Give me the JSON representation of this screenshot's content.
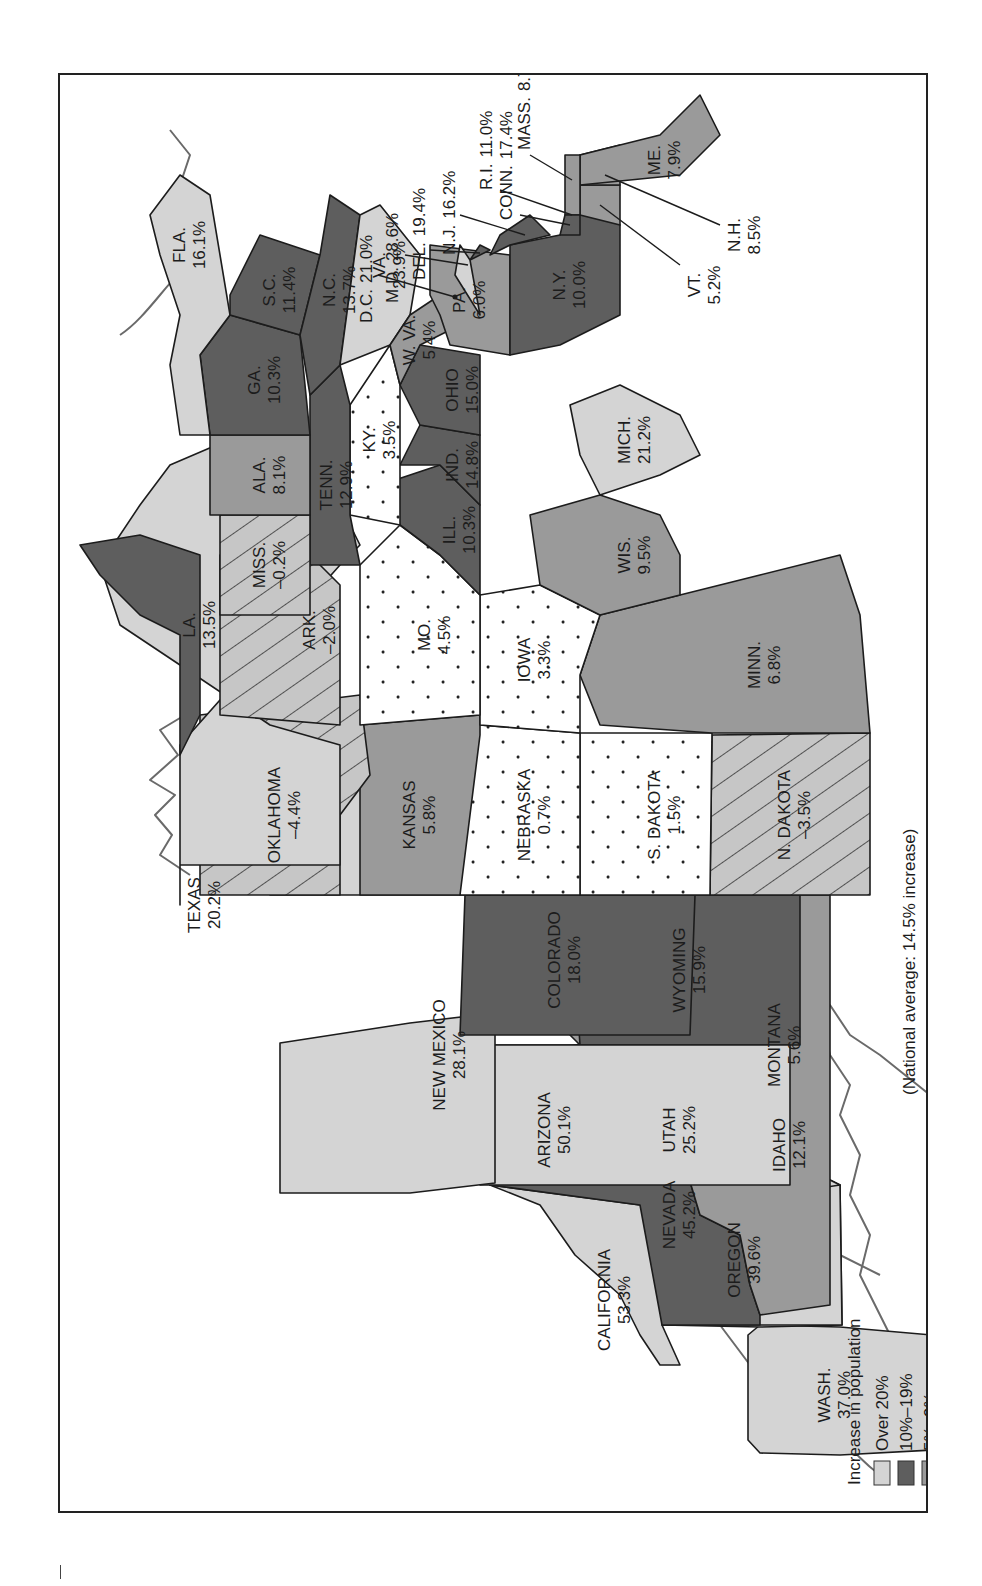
{
  "legend": {
    "increase_title": "Increase in population",
    "decrease_title": "Decrease in population",
    "items": [
      {
        "label": "Over 20%",
        "color": "#d4d4d4",
        "pattern": "solid"
      },
      {
        "label": "10%–19%",
        "color": "#5e5e5e",
        "pattern": "solid"
      },
      {
        "label": "5%–9%",
        "color": "#9a9a9a",
        "pattern": "solid"
      },
      {
        "label": "0%–4%",
        "color": "#ffffff",
        "pattern": "dots"
      },
      {
        "label": "0%–5%",
        "color": "#c6c6c6",
        "pattern": "hatch"
      }
    ]
  },
  "note": "(National average: 14.5% increase)",
  "states": {
    "wa": {
      "name": "WASH.",
      "value": "37.0%"
    },
    "or": {
      "name": "OREGON",
      "value": "39.6%"
    },
    "ca": {
      "name": "CALIFORNIA",
      "value": "53.3%"
    },
    "nv": {
      "name": "NEVADA",
      "value": "45.2%"
    },
    "id": {
      "name": "IDAHO",
      "value": "12.1%"
    },
    "mt": {
      "name": "MONTANA",
      "value": "5.6%"
    },
    "wy": {
      "name": "WYOMING",
      "value": "15.9%"
    },
    "ut": {
      "name": "UTAH",
      "value": "25.2%"
    },
    "az": {
      "name": "ARIZONA",
      "value": "50.1%"
    },
    "co": {
      "name": "COLORADO",
      "value": "18.0%"
    },
    "nm": {
      "name": "NEW MEXICO",
      "value": "28.1%"
    },
    "nd": {
      "name": "N. DAKOTA",
      "value": "–3.5%"
    },
    "sd": {
      "name": "S. DAKOTA",
      "value": "1.5%"
    },
    "ne": {
      "name": "NEBRASKA",
      "value": "0.7%"
    },
    "ks": {
      "name": "KANSAS",
      "value": "5.8%"
    },
    "ok": {
      "name": "OKLAHOMA",
      "value": "–4.4%"
    },
    "tx": {
      "name": "TEXAS",
      "value": "20.2%"
    },
    "mn": {
      "name": "MINN.",
      "value": "6.8%"
    },
    "ia": {
      "name": "IOWA",
      "value": "3.3%"
    },
    "mo": {
      "name": "MO.",
      "value": "4.5%"
    },
    "ar": {
      "name": "ARK.",
      "value": "–2.0%"
    },
    "la": {
      "name": "LA.",
      "value": "13.5%"
    },
    "wi": {
      "name": "WIS.",
      "value": "9.5%"
    },
    "il": {
      "name": "ILL.",
      "value": "10.3%"
    },
    "mi": {
      "name": "MICH.",
      "value": "21.2%"
    },
    "in": {
      "name": "IND.",
      "value": "14.8%"
    },
    "oh": {
      "name": "OHIO",
      "value": "15.0%"
    },
    "ky": {
      "name": "KY.",
      "value": "3.5%"
    },
    "tn": {
      "name": "TENN.",
      "value": "12.9%"
    },
    "ms": {
      "name": "MISS.",
      "value": "–0.2%"
    },
    "al": {
      "name": "ALA.",
      "value": "8.1%"
    },
    "ga": {
      "name": "GA.",
      "value": "10.3%"
    },
    "fl": {
      "name": "FLA.",
      "value": "16.1%"
    },
    "sc": {
      "name": "S.C.",
      "value": "11.4%"
    },
    "nc": {
      "name": "N.C.",
      "value": "13.7%"
    },
    "va": {
      "name": "VA.",
      "value": "23.9%"
    },
    "wv": {
      "name": "W. VA.",
      "value": "5.4%"
    },
    "pa": {
      "name": "PA.",
      "value": "6.0%"
    },
    "ny": {
      "name": "N.Y.",
      "value": "10.0%"
    },
    "vt": {
      "name": "VT.",
      "value": "5.2%"
    },
    "nh": {
      "name": "N.H.",
      "value": "8.5%"
    },
    "me": {
      "name": "ME.",
      "value": "7.9%"
    },
    "ma": {
      "name": "MASS.",
      "value": "8.7%"
    },
    "ri": {
      "name": "R.I.",
      "value": "11.0%"
    },
    "ct": {
      "name": "CONN.",
      "value": "17.4%"
    },
    "nj": {
      "name": "N.J.",
      "value": "16.2%"
    },
    "de": {
      "name": "DEL.",
      "value": "19.4%"
    },
    "md": {
      "name": "M.D.",
      "value": "28.6%"
    },
    "dc": {
      "name": "D.C.",
      "value": "21.0%"
    }
  }
}
